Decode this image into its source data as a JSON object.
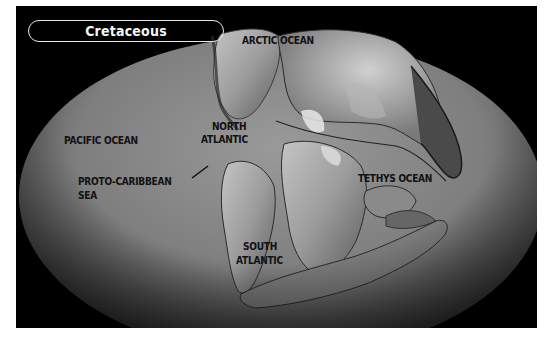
{
  "title": "Cretaceous",
  "map": {
    "period": "Cretaceous",
    "projection": "elliptical world map (paleogeographic reconstruction)",
    "labels": [
      {
        "id": "arctic",
        "text": "ARCTIC OCEAN"
      },
      {
        "id": "pacific",
        "text": "PACIFIC OCEAN"
      },
      {
        "id": "north_atlantic_1",
        "text": "NORTH"
      },
      {
        "id": "north_atlantic_2",
        "text": "ATLANTIC"
      },
      {
        "id": "proto_caribbean_1",
        "text": "PROTO-CARIBBEAN"
      },
      {
        "id": "proto_caribbean_2",
        "text": "SEA"
      },
      {
        "id": "tethys",
        "text": "TETHYS OCEAN"
      },
      {
        "id": "south_atlantic_1",
        "text": "SOUTH"
      },
      {
        "id": "south_atlantic_2",
        "text": "ATLANTIC"
      }
    ]
  },
  "colors": {
    "frame": "#000000",
    "ocean": "#8a8a8a",
    "land": "#a8a8a8",
    "title_text": "#f4f4f4",
    "label_text": "#111111"
  }
}
